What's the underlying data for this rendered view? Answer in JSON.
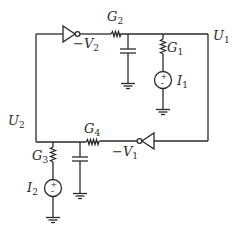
{
  "diagram": {
    "type": "circuit-schematic",
    "colors": {
      "wire": "#2a2a2a",
      "background": "#ffffff"
    },
    "nodes": {
      "U1": {
        "label": "U",
        "sub": "1"
      },
      "U2": {
        "label": "U",
        "sub": "2"
      }
    },
    "components": {
      "inv_top": {
        "type": "inverter",
        "output_label": "−V",
        "output_sub": "2"
      },
      "inv_bottom": {
        "type": "inverter",
        "output_label": "−V",
        "output_sub": "1"
      },
      "G1": {
        "type": "resistor",
        "label": "G",
        "sub": "1"
      },
      "G2": {
        "type": "resistor",
        "label": "G",
        "sub": "2"
      },
      "G3": {
        "type": "resistor",
        "label": "G",
        "sub": "3"
      },
      "G4": {
        "type": "resistor",
        "label": "G",
        "sub": "4"
      },
      "I1": {
        "type": "current-source",
        "label": "I",
        "sub": "1",
        "plus": "+",
        "minus": "-"
      },
      "I2": {
        "type": "current-source",
        "label": "I",
        "sub": "2",
        "plus": "+",
        "minus": "-"
      },
      "C_top": {
        "type": "capacitor"
      },
      "C_bottom": {
        "type": "capacitor"
      }
    }
  }
}
